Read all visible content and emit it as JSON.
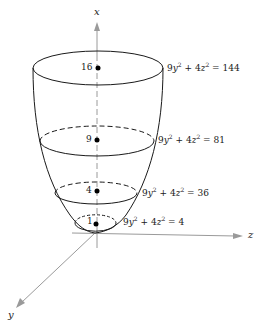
{
  "diagram": {
    "type": "elliptic-paraboloid",
    "axes": {
      "x_label": "x",
      "y_label": "y",
      "z_label": "z",
      "color": "#9a9a9a"
    },
    "level_curves": [
      {
        "level": "16",
        "equation": {
          "a": "9",
          "v1": "y",
          "b": "4",
          "v2": "z",
          "rhs": "144"
        }
      },
      {
        "level": "9",
        "equation": {
          "a": "9",
          "v1": "y",
          "b": "4",
          "v2": "z",
          "rhs": "81"
        }
      },
      {
        "level": "4",
        "equation": {
          "a": "9",
          "v1": "y",
          "b": "4",
          "v2": "z",
          "rhs": "36"
        }
      },
      {
        "level": "1",
        "equation": {
          "a": "9",
          "v1": "y",
          "b": "4",
          "v2": "z",
          "rhs": "4"
        }
      }
    ],
    "stroke_color": "#1a1a1a"
  }
}
